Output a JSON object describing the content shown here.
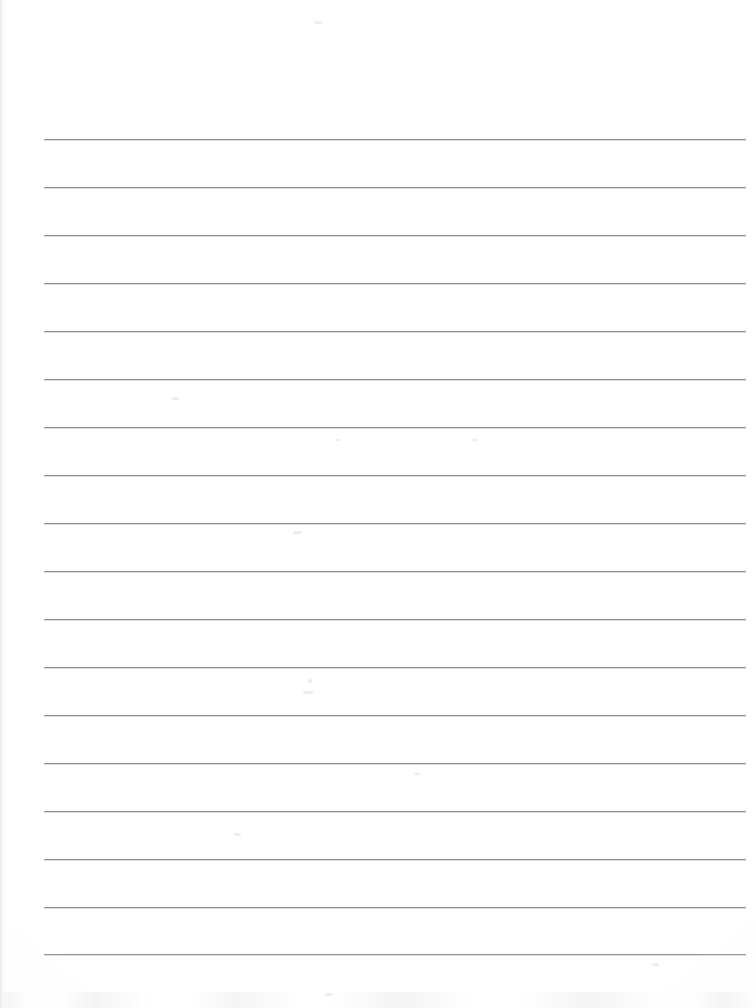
{
  "document": {
    "kind": "scanned-ruled-paper",
    "title": "Blank Ruled Notebook Page",
    "page_width": 756,
    "page_height": 1008,
    "paper_color": "#ffffff",
    "content_text": "",
    "has_handwriting": false,
    "has_printed_text": false
  },
  "ruling": {
    "line_color": "#8f9093",
    "line_shadow_color": "#c4c5c8",
    "line_thickness": 1,
    "line_count": 18,
    "left_margin_x": 44,
    "right_margin_x": 746,
    "line_length": 702,
    "first_line_y": 139,
    "line_spacing": 48,
    "top_blank_margin": 139,
    "bottom_blank_margin": 54,
    "line_y_positions": [
      139,
      187,
      235,
      283,
      331,
      379,
      427,
      475,
      523,
      571,
      619,
      667,
      715,
      763,
      811,
      859,
      907,
      954
    ]
  },
  "artifacts": {
    "left_edge_shadow": true,
    "bottom_edge_noise": true,
    "specks": [
      {
        "x": 293,
        "y": 531,
        "w": 9,
        "h": 3
      },
      {
        "x": 308,
        "y": 679,
        "w": 4,
        "h": 4
      },
      {
        "x": 303,
        "y": 691,
        "w": 11,
        "h": 3
      },
      {
        "x": 172,
        "y": 397,
        "w": 7,
        "h": 3
      },
      {
        "x": 335,
        "y": 439,
        "w": 6,
        "h": 2
      },
      {
        "x": 472,
        "y": 439,
        "w": 6,
        "h": 2
      },
      {
        "x": 234,
        "y": 833,
        "w": 7,
        "h": 3
      },
      {
        "x": 414,
        "y": 773,
        "w": 6,
        "h": 2
      },
      {
        "x": 325,
        "y": 993,
        "w": 8,
        "h": 3
      },
      {
        "x": 652,
        "y": 963,
        "w": 7,
        "h": 3
      },
      {
        "x": 314,
        "y": 21,
        "w": 8,
        "h": 3
      }
    ]
  }
}
